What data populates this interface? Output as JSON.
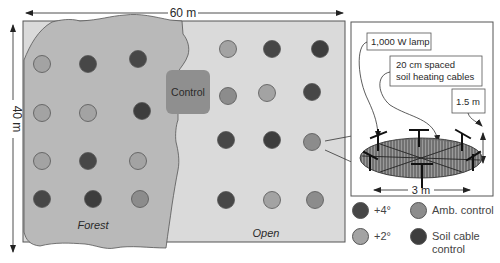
{
  "dimensions": {
    "width_label": "60 m",
    "height_label": "40 m",
    "plot_diameter_label": "3 m",
    "lamp_height_label": "1.5 m"
  },
  "regions": {
    "forest_label": "Forest",
    "open_label": "Open",
    "control_label": "Control"
  },
  "detail_panel": {
    "lamp_label": "1,000 W lamp",
    "cables_label_line1": "20 cm spaced",
    "cables_label_line2": "soil heating cables"
  },
  "legend": {
    "items": [
      {
        "label": "+4°",
        "color": "#474747"
      },
      {
        "label": "Amb. control",
        "color": "#8c8c8c"
      },
      {
        "label": "+2°",
        "color": "#a3a3a3"
      },
      {
        "label_line1": "Soil cable",
        "label_line2": "control",
        "color": "#3d3d3d"
      }
    ]
  },
  "colors": {
    "field": "#d9d9d9",
    "forest": "#b8b8b8",
    "control_box": "#8f8f8f",
    "plus4": "#474747",
    "plus2": "#a3a3a3",
    "amb_control": "#8c8c8c",
    "soil_cable_control": "#3d3d3d"
  },
  "plots": {
    "forest": [
      {
        "row": 1,
        "col": 1,
        "treatment": "+2°"
      },
      {
        "row": 1,
        "col": 2,
        "treatment": "+4°"
      },
      {
        "row": 1,
        "col": 3,
        "treatment": "+4°"
      },
      {
        "row": 2,
        "col": 1,
        "treatment": "+2°"
      },
      {
        "row": 2,
        "col": 2,
        "treatment": "+2°"
      },
      {
        "row": 2,
        "col": 3,
        "treatment": "Soil cable control"
      },
      {
        "row": 3,
        "col": 1,
        "treatment": "+2°"
      },
      {
        "row": 3,
        "col": 2,
        "treatment": "+4°"
      },
      {
        "row": 3,
        "col": 3,
        "treatment": "+2°"
      },
      {
        "row": 4,
        "col": 1,
        "treatment": "+4°"
      },
      {
        "row": 4,
        "col": 2,
        "treatment": "Soil cable control"
      },
      {
        "row": 4,
        "col": 3,
        "treatment": "Amb. control"
      }
    ],
    "open": [
      {
        "row": 1,
        "col": 1,
        "treatment": "+2°"
      },
      {
        "row": 1,
        "col": 2,
        "treatment": "+4°"
      },
      {
        "row": 1,
        "col": 3,
        "treatment": "Soil cable control"
      },
      {
        "row": 2,
        "col": 1,
        "treatment": "Amb. control"
      },
      {
        "row": 2,
        "col": 2,
        "treatment": "+2°"
      },
      {
        "row": 2,
        "col": 3,
        "treatment": "+4°"
      },
      {
        "row": 3,
        "col": 1,
        "treatment": "+4°"
      },
      {
        "row": 3,
        "col": 2,
        "treatment": "Soil cable control"
      },
      {
        "row": 3,
        "col": 3,
        "treatment": "Amb. control"
      },
      {
        "row": 4,
        "col": 1,
        "treatment": "+4°"
      },
      {
        "row": 4,
        "col": 2,
        "treatment": "+2°"
      },
      {
        "row": 4,
        "col": 3,
        "treatment": "Amb. control"
      }
    ]
  }
}
